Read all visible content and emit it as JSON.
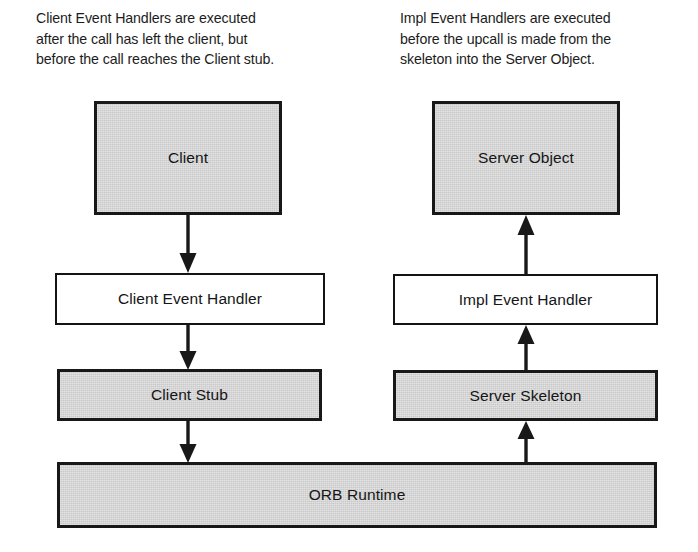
{
  "diagram": {
    "captions": {
      "left": "Client Event Handlers are executed\nafter the call has left the client, but\nbefore the call reaches the Client stub.",
      "right": "Impl Event Handlers are executed\nbefore the upcall is made from the\nskeleton into the Server Object."
    },
    "nodes": {
      "client": "Client",
      "client_event_handler": "Client Event Handler",
      "client_stub": "Client Stub",
      "server_object": "Server Object",
      "impl_event_handler": "Impl Event Handler",
      "server_skeleton": "Server Skeleton",
      "orb_runtime": "ORB Runtime"
    },
    "arrows": [
      {
        "name": "client-to-client-event-handler",
        "direction": "down"
      },
      {
        "name": "client-event-handler-to-client-stub",
        "direction": "down"
      },
      {
        "name": "client-stub-to-orb-runtime",
        "direction": "down"
      },
      {
        "name": "impl-event-handler-to-server-object",
        "direction": "up"
      },
      {
        "name": "server-skeleton-to-impl-event-handler",
        "direction": "up"
      },
      {
        "name": "orb-runtime-to-server-skeleton",
        "direction": "up"
      }
    ],
    "colors": {
      "shaded_fill": "#c9c9c9",
      "stroke": "#181818",
      "plain_fill": "#ffffff",
      "background": "#ffffff",
      "text": "#151515"
    }
  }
}
